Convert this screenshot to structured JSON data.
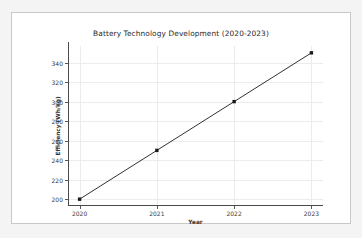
{
  "chart_data": {
    "type": "line",
    "title": "Battery Technology Development (2020-2023)",
    "xlabel": "Year",
    "ylabel": "Efficiency (Wh/kg)",
    "x": [
      2020,
      2021,
      2022,
      2023
    ],
    "values": [
      200,
      250,
      300,
      350
    ],
    "series": [
      {
        "name": "Efficiency",
        "values": [
          200,
          250,
          300,
          350
        ],
        "color": "#1a1a1a",
        "marker": "square",
        "line_style": "solid"
      }
    ],
    "xtick_labels": [
      "2020",
      "2021",
      "2022",
      "2023"
    ],
    "ytick_labels": [
      "200",
      "220",
      "240",
      "260",
      "280",
      "300",
      "320",
      "340"
    ],
    "yticks": [
      200,
      220,
      240,
      260,
      280,
      300,
      320,
      340
    ],
    "xlim": [
      2019.85,
      2023.15
    ],
    "ylim": [
      193,
      357
    ],
    "grid": true,
    "grid_color": "#ececed",
    "legend": null,
    "legend_position": "none",
    "background_color": "#ffffff",
    "page_background_color": "#f4f4f4",
    "axis_color": "#4a4a4a"
  }
}
